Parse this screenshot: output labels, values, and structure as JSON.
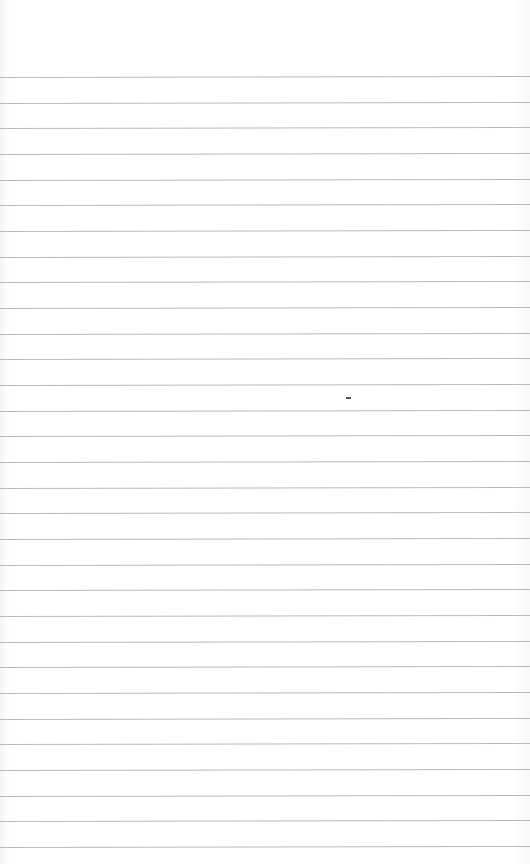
{
  "image": {
    "description": "Blank sheet of ruled (lined) paper",
    "background_color": "#ffffff",
    "rule_color": "#b9b9b9",
    "rules": {
      "count": 31,
      "first_y": 77,
      "spacing": 25.67
    },
    "marks": [
      {
        "x": 346,
        "y": 397,
        "w": 5,
        "h": 2,
        "color": "#555555"
      }
    ]
  }
}
